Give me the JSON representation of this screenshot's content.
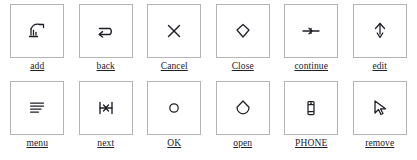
{
  "page": {
    "columns": 6,
    "rows": 2,
    "box_border_color": "#b4b4b4",
    "ink_color": "#1f1f27",
    "background_color": "#ffffff"
  },
  "icons": [
    {
      "label": "add",
      "icon_name": "add-sketch-icon",
      "row": 1,
      "col": 1
    },
    {
      "label": "back",
      "icon_name": "u-turn-arrow-icon",
      "row": 1,
      "col": 2
    },
    {
      "label": "Cancel",
      "icon_name": "x-cross-icon",
      "row": 1,
      "col": 3
    },
    {
      "label": "Close",
      "icon_name": "diamond-outline-icon",
      "row": 1,
      "col": 4
    },
    {
      "label": "continue",
      "icon_name": "arrow-right-line-icon",
      "row": 1,
      "col": 5
    },
    {
      "label": "edit",
      "icon_name": "pen-nib-icon",
      "row": 1,
      "col": 6
    },
    {
      "label": "menu",
      "icon_name": "hamburger-lines-icon",
      "row": 2,
      "col": 1
    },
    {
      "label": "next",
      "icon_name": "skip-next-bars-icon",
      "row": 2,
      "col": 2
    },
    {
      "label": "OK",
      "icon_name": "circle-outline-icon",
      "row": 2,
      "col": 3
    },
    {
      "label": "open",
      "icon_name": "diamond-drop-icon",
      "row": 2,
      "col": 4
    },
    {
      "label": "PHONE",
      "icon_name": "mobile-phone-icon",
      "row": 2,
      "col": 5
    },
    {
      "label": "remove",
      "icon_name": "cursor-arrow-icon",
      "row": 2,
      "col": 6
    }
  ]
}
